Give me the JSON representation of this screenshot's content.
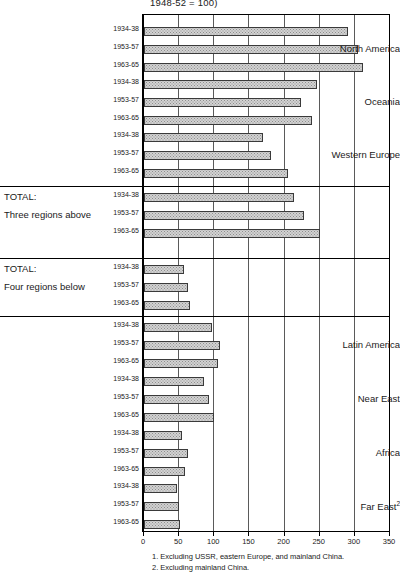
{
  "chart_data": {
    "type": "bar",
    "orientation": "horizontal",
    "title": "1948-52 = 100)",
    "xlabel": "",
    "ylabel": "",
    "xlim": [
      0,
      350
    ],
    "xticks": [
      0,
      50,
      100,
      150,
      200,
      250,
      300,
      350
    ],
    "xticklabels": [
      "0",
      "50",
      "100",
      "150",
      "200",
      "250",
      "300",
      "350"
    ],
    "grid": true,
    "legend": null,
    "periods": [
      "1934-38",
      "1953-57",
      "1963-65"
    ],
    "groups": [
      {
        "label": "North America",
        "label_align": "right",
        "values": [
          290,
          305,
          312
        ]
      },
      {
        "label": "Oceania",
        "label_align": "right",
        "values": [
          246,
          224,
          239
        ]
      },
      {
        "label": "Western Europe",
        "label_align": "right",
        "values": [
          170,
          180,
          205
        ]
      },
      {
        "label": "TOTAL:",
        "label2": "Three regions above",
        "label_align": "left",
        "values": [
          213,
          227,
          250
        ]
      },
      {
        "label": "TOTAL:",
        "label2": "Four regions below",
        "label_align": "left",
        "values": [
          57,
          62,
          66
        ]
      },
      {
        "label": "Latin America",
        "label_align": "right",
        "values": [
          97,
          108,
          105
        ]
      },
      {
        "label": "Near East",
        "label_align": "right",
        "values": [
          86,
          92,
          99
        ]
      },
      {
        "label": "Africa",
        "label_align": "right",
        "values": [
          54,
          62,
          58
        ]
      },
      {
        "label": "Far East",
        "label_align": "right",
        "footnote_marker": "2",
        "values": [
          47,
          50,
          51
        ]
      }
    ],
    "footnotes": [
      "1. Excluding USSR, eastern Europe, and mainland China.",
      "2. Excluding mainland China."
    ],
    "colors": {
      "bar_fill": "#d2d2d2",
      "bar_edge": "#3a3a3a",
      "axis": "#000000",
      "grid": "#5a5a5a",
      "text": "#1a1a1a"
    }
  }
}
